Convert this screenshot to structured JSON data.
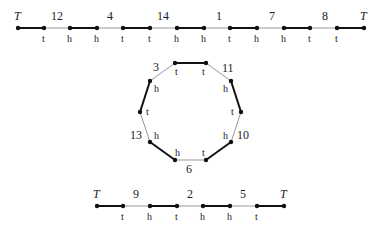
{
  "top_path": {
    "end_left": "T",
    "end_right": "T",
    "numbers": [
      "12",
      "4",
      "14",
      "1",
      "7",
      "8"
    ],
    "ends": [
      "t",
      "h",
      "h",
      "t",
      "t",
      "h",
      "h",
      "t",
      "h",
      "h",
      "t",
      "t",
      "h"
    ]
  },
  "cycle": {
    "numbers": [
      "3",
      "11",
      "10",
      "6",
      "13"
    ],
    "ends": {
      "top_left": "t",
      "top_right": "t",
      "upper_right": "h",
      "right": "t",
      "lower_right": "h",
      "bottom_right": "t",
      "bottom_left": "h",
      "lower_left": "h",
      "left": "t",
      "upper_left": "h"
    }
  },
  "bottom_path": {
    "end_left": "T",
    "end_right": "T",
    "numbers": [
      "9",
      "2",
      "5"
    ],
    "ends": [
      "t",
      "h",
      "t",
      "h",
      "h",
      "t"
    ]
  },
  "colors": {
    "thick_edge": "#111111",
    "thin_edge": "#999999",
    "node": "#111111"
  }
}
